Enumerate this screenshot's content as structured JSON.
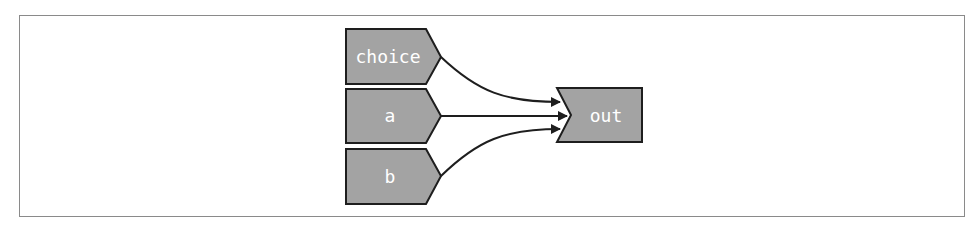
{
  "diagram": {
    "type": "dataflow",
    "colors": {
      "node_fill": "#a3a3a3",
      "node_stroke": "#1e1e1e",
      "edge": "#1e1e1e",
      "label": "#ffffff",
      "frame": "#8a8a8a"
    },
    "inputs": [
      {
        "id": "choice",
        "label": "choice"
      },
      {
        "id": "a",
        "label": "a"
      },
      {
        "id": "b",
        "label": "b"
      }
    ],
    "output": {
      "id": "out",
      "label": "out"
    },
    "edges": [
      {
        "from": "choice",
        "to": "out"
      },
      {
        "from": "a",
        "to": "out"
      },
      {
        "from": "b",
        "to": "out"
      }
    ]
  }
}
